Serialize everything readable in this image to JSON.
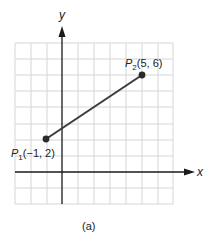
{
  "figure": {
    "caption": "(a)",
    "axes": {
      "x_label": "x",
      "y_label": "y"
    },
    "grid": {
      "x_min": -3,
      "x_max": 7,
      "y_min": -2,
      "y_max": 8,
      "step": 1
    },
    "points": [
      {
        "name": "P",
        "subscript": "1",
        "coords": "(−1, 2)",
        "x": -1,
        "y": 2
      },
      {
        "name": "P",
        "subscript": "2",
        "coords": "(5, 6)",
        "x": 5,
        "y": 6
      }
    ],
    "segment": {
      "from": "P1",
      "to": "P2"
    },
    "colors": {
      "grid": "#d6d6d6",
      "axis": "#1a1a1a",
      "segment": "#3a3a3a",
      "point": "#2a2a2a"
    }
  }
}
